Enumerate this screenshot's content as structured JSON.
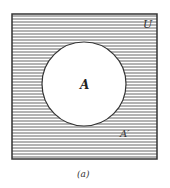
{
  "diagram": {
    "type": "venn",
    "universe_label": "U",
    "set_label": "A",
    "complement_label": "A′",
    "caption": "(a)",
    "shaded_region": "A complement (outside circle)",
    "colors": {
      "line": "#333333",
      "hatch": "#555555",
      "background": "#ffffff"
    }
  }
}
